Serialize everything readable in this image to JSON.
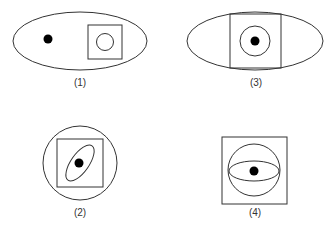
{
  "figures": [
    {
      "id": 1,
      "label": "(1)",
      "description": "Ellipse containing a black dot on the left and a square with a circle inside on the right"
    },
    {
      "id": 3,
      "label": "(3)",
      "description": "Ellipse with a square inside; square contains a circle with a black dot at center"
    },
    {
      "id": 2,
      "label": "(2)",
      "description": "Circle containing a square; square contains a tilted ellipse with a black dot at center"
    },
    {
      "id": 4,
      "label": "(4)",
      "description": "Square containing a circle; circle contains a horizontal ellipse with a black dot at center"
    }
  ],
  "colors": {
    "stroke": "#333333",
    "dot": "#000000",
    "background": "#ffffff"
  }
}
